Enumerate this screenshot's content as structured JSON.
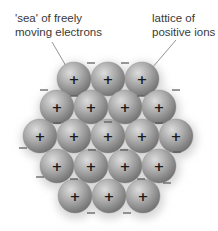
{
  "labels": {
    "sea": {
      "line1": "'sea' of freely",
      "line2": "moving electrons"
    },
    "lattice": {
      "line1": "lattice of",
      "line2": "positive ions"
    }
  },
  "symbols": {
    "ion": "+",
    "electron": "–"
  },
  "colors": {
    "text": "#3a3a3a",
    "sphere_light": "#d8d8d8",
    "sphere_mid": "#a8a8a8",
    "sphere_dark": "#6e6e6e",
    "leader_line": "#777777",
    "electron": "#555555"
  },
  "lattice": {
    "radius": 17,
    "rows": [
      {
        "y": 79,
        "x": [
          74,
          108,
          142
        ]
      },
      {
        "y": 107,
        "x": [
          57,
          91,
          125,
          159
        ]
      },
      {
        "y": 136,
        "x": [
          40,
          74,
          108,
          142,
          176
        ]
      },
      {
        "y": 166,
        "x": [
          57,
          91,
          125,
          159
        ]
      },
      {
        "y": 196,
        "x": [
          75,
          109,
          143
        ]
      }
    ]
  },
  "electrons": [
    {
      "x": 91,
      "y": 63
    },
    {
      "x": 125,
      "y": 63
    },
    {
      "x": 44,
      "y": 90
    },
    {
      "x": 176,
      "y": 90
    },
    {
      "x": 74,
      "y": 96
    },
    {
      "x": 141,
      "y": 96
    },
    {
      "x": 57,
      "y": 123
    },
    {
      "x": 108,
      "y": 122
    },
    {
      "x": 159,
      "y": 123
    },
    {
      "x": 23,
      "y": 148
    },
    {
      "x": 92,
      "y": 150
    },
    {
      "x": 124,
      "y": 150
    },
    {
      "x": 177,
      "y": 152
    },
    {
      "x": 40,
      "y": 177
    },
    {
      "x": 74,
      "y": 179
    },
    {
      "x": 141,
      "y": 179
    },
    {
      "x": 167,
      "y": 183
    },
    {
      "x": 91,
      "y": 213
    },
    {
      "x": 127,
      "y": 213
    }
  ],
  "leaders": [
    {
      "name": "sea-leader",
      "x1": 52,
      "y1": 42,
      "x2": 66,
      "y2": 66
    },
    {
      "name": "lattice-leader",
      "x1": 176,
      "y1": 40,
      "x2": 152,
      "y2": 68
    }
  ]
}
